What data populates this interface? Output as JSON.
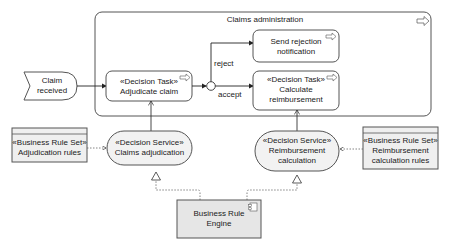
{
  "diagram": {
    "type": "ArchiMate-style business process / decision model",
    "container": {
      "label": "Claims administration",
      "icon": "process-arrow-icon"
    },
    "event": {
      "line1": "Claim",
      "line2": "received"
    },
    "tasks": [
      {
        "id": "adjudicate",
        "stereotype": "«Decision Task»",
        "line1": "Adjudicate claim",
        "icon": "process-arrow-icon"
      },
      {
        "id": "send_rejection",
        "line1": "Send rejection",
        "line2": "notification",
        "icon": "process-arrow-icon"
      },
      {
        "id": "calculate",
        "stereotype": "«Decision Task»",
        "line1": "Calculate",
        "line2": "reimbursement",
        "icon": "process-arrow-icon"
      }
    ],
    "junction": {
      "branches": [
        "reject",
        "accept"
      ]
    },
    "services": [
      {
        "id": "claims_adj",
        "stereotype": "«Decision Service»",
        "line1": "Claims adjudication"
      },
      {
        "id": "reimb_calc",
        "stereotype": "«Decision Service»",
        "line1": "Reimbursement",
        "line2": "calculation"
      }
    ],
    "rule_sets": [
      {
        "id": "adj_rules",
        "stereotype": "«Business Rule Set»",
        "line1": "Adjudication rules"
      },
      {
        "id": "reimb_rules",
        "stereotype": "«Business Rule Set»",
        "line1": "Reimbursement",
        "line2": "calculation rules"
      }
    ],
    "component": {
      "line1": "Business Rule",
      "line2": "Engine",
      "icon": "component-icon"
    },
    "colors": {
      "stroke": "#555555",
      "fill_light": "#f2f2f2",
      "fill_gray": "#e6e6e6",
      "text": "#1a1a1a"
    }
  }
}
